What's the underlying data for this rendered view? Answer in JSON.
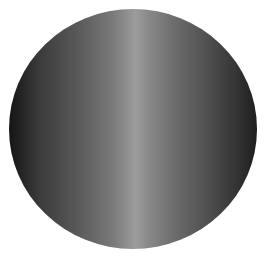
{
  "image": {
    "subject": "gray-gradient-disc",
    "colors": {
      "background": "#ffffff",
      "edge_dark": "#151515",
      "highlight": "#9c9c9c"
    }
  }
}
